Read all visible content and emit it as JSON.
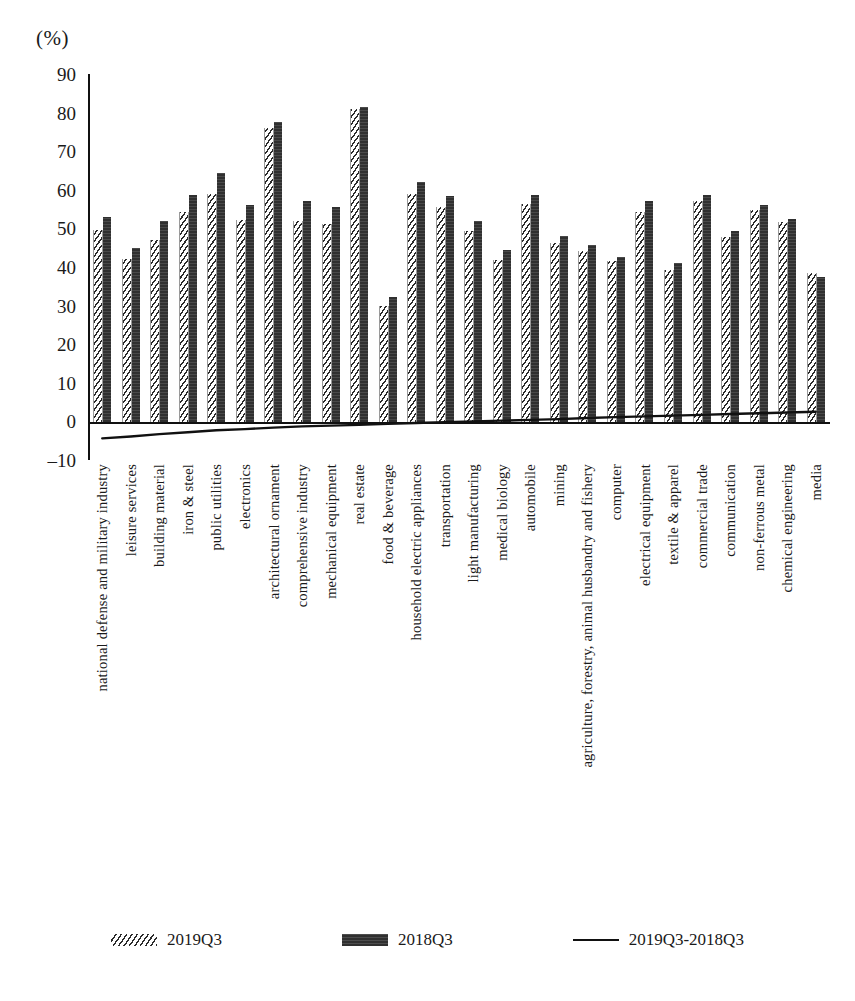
{
  "chart_data": {
    "type": "bar",
    "title": "",
    "subtitle": "",
    "xlabel": "",
    "ylabel": "",
    "unit_label": "(%)",
    "ylim": [
      -10,
      90
    ],
    "ytick_step": 10,
    "yticks": [
      90,
      80,
      70,
      60,
      50,
      40,
      30,
      20,
      10,
      0,
      "–10"
    ],
    "grid": false,
    "legend_position": "bottom",
    "categories": [
      "national defense and military industry",
      "leisure services",
      "building material",
      "iron & steel",
      "public utilities",
      "electronics",
      "architectural ornament",
      "comprehensive industry",
      "mechanical equipment",
      "real estate",
      "food & beverage",
      "household electric appliances",
      "transportation",
      "light manufacturing",
      "medical biology",
      "automobile",
      "mining",
      "agriculture, forestry, animal husbandry and fishery",
      "computer",
      "electrical equipment",
      "textile & apparel",
      "commercial trade",
      "communication",
      "non-ferrous metal",
      "chemical engineering",
      "media"
    ],
    "series": [
      {
        "name": "2019Q3",
        "style": "hatched-bar",
        "values": [
          49.8,
          42.3,
          47.2,
          54.4,
          59.2,
          52.4,
          76.2,
          52.0,
          51.3,
          81.0,
          30.0,
          59.0,
          55.6,
          49.6,
          42.1,
          56.4,
          46.3,
          44.2,
          41.6,
          54.3,
          39.5,
          57.3,
          48.0,
          54.8,
          51.8,
          38.6
        ]
      },
      {
        "name": "2018Q3",
        "style": "solid-bar",
        "values": [
          53.2,
          45.2,
          52.2,
          58.9,
          64.5,
          56.3,
          77.6,
          57.2,
          55.8,
          81.5,
          32.4,
          62.2,
          58.5,
          52.2,
          44.5,
          58.9,
          48.3,
          45.8,
          42.8,
          57.2,
          41.3,
          58.9,
          49.5,
          56.1,
          52.5,
          37.6
        ]
      },
      {
        "name": "2019Q3-2018Q3",
        "style": "line",
        "values": [
          -3.4,
          -2.9,
          -5.0,
          -4.5,
          -5.3,
          -3.9,
          -1.4,
          -5.2,
          -4.5,
          -0.5,
          -2.4,
          -3.2,
          -2.9,
          -2.6,
          -2.4,
          -2.5,
          -2.0,
          -1.6,
          -1.2,
          -2.9,
          -1.8,
          -1.6,
          -1.5,
          -1.3,
          -0.7,
          1.0
        ]
      }
    ],
    "diff_line_points": [
      -4.4,
      -3.9,
      -3.3,
      -2.8,
      -2.3,
      -2.0,
      -1.6,
      -1.3,
      -1.1,
      -0.9,
      -0.6,
      -0.4,
      -0.2,
      0.0,
      0.2,
      0.4,
      0.6,
      0.9,
      1.1,
      1.3,
      1.5,
      1.7,
      1.9,
      2.1,
      2.3,
      2.5
    ]
  },
  "legend": {
    "items": [
      {
        "label": "2019Q3",
        "swatch": "hatch-swatch"
      },
      {
        "label": "2018Q3",
        "swatch": "solid-swatch"
      },
      {
        "label": "2019Q3-2018Q3",
        "swatch": "line-swatch"
      }
    ]
  }
}
